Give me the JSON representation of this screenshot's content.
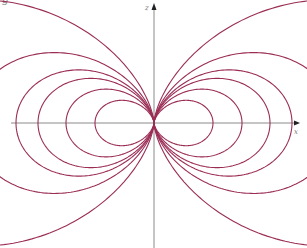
{
  "figure": {
    "corner_text": "g",
    "origin": [
      154,
      123
    ],
    "axes": {
      "color": "#8a8a8a",
      "x_label": "x",
      "z_label": "z",
      "x_range_px": [
        11,
        300
      ],
      "z_range_px": [
        3,
        248
      ]
    },
    "field_lines": {
      "color": "#9b2d55",
      "equation": "r = C sin^2(theta)",
      "closed_loop_C_px": [
        59,
        88,
        116,
        138
      ],
      "open_curve_C_px": [
        183,
        320
      ]
    }
  }
}
